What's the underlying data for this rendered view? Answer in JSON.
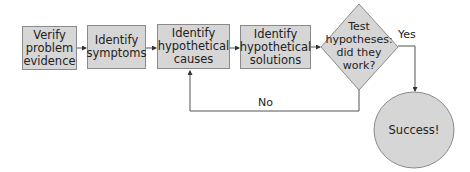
{
  "flowchart": {
    "steps": [
      {
        "lines": [
          "Verify",
          "problem",
          "evidence"
        ]
      },
      {
        "lines": [
          "Identify",
          "symptoms"
        ]
      },
      {
        "lines": [
          "Identify",
          "hypothetical",
          "causes"
        ]
      },
      {
        "lines": [
          "Identify",
          "hypothetical",
          "solutions"
        ]
      }
    ],
    "decision": {
      "lines": [
        "Test",
        "hypotheses:",
        "did they",
        "work?"
      ]
    },
    "yes_label": "Yes",
    "no_label": "No",
    "outcome": "Success!"
  },
  "colors": {
    "shape_fill": "#d6d6d6",
    "shape_border": "#8a8a8a",
    "connector": "#555555",
    "text": "#222222"
  }
}
